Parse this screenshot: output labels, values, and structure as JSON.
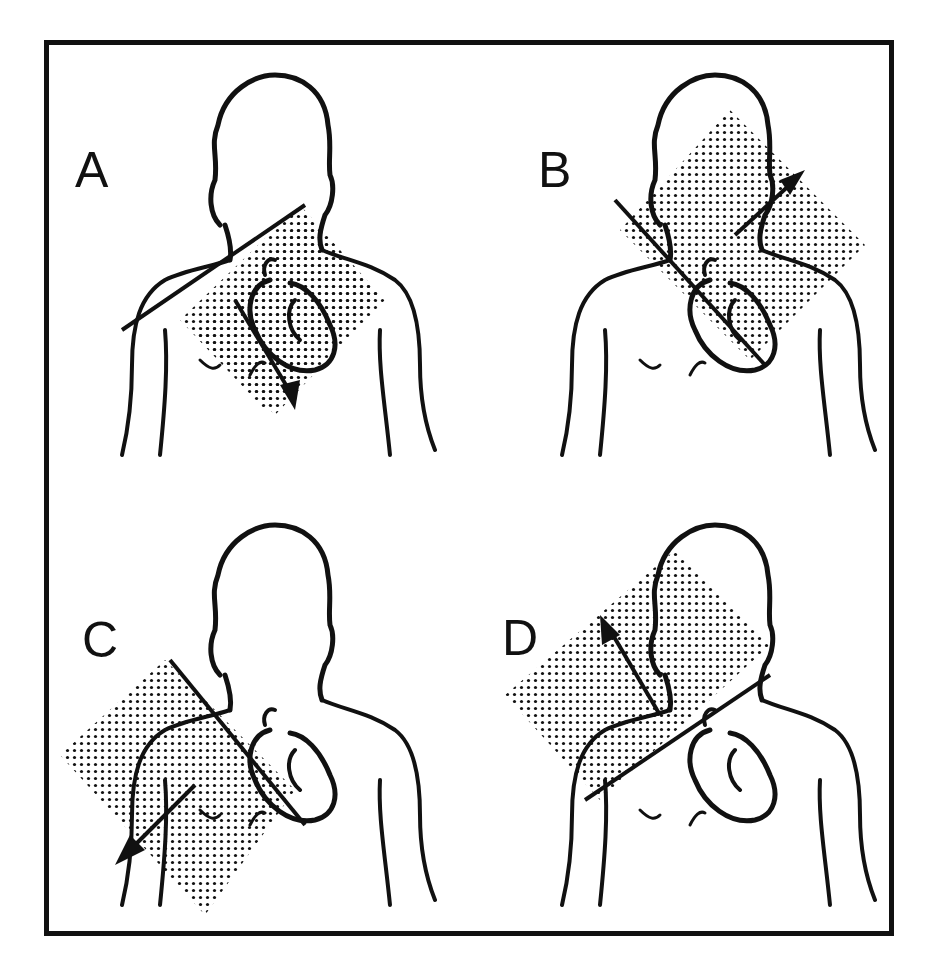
{
  "figure": {
    "colors": {
      "line": "#111111",
      "dots": "#111111",
      "background": "#ffffff"
    },
    "panels": [
      {
        "id": "A",
        "label": "A",
        "axis_arrow": "down-right",
        "shaded_region": "lower-left diamond"
      },
      {
        "id": "B",
        "label": "B",
        "axis_arrow": "up-right",
        "shaded_region": "upper-right diamond"
      },
      {
        "id": "C",
        "label": "C",
        "axis_arrow": "down-left",
        "shaded_region": "lower-left diamond"
      },
      {
        "id": "D",
        "label": "D",
        "axis_arrow": "up-left",
        "shaded_region": "upper-left diamond"
      }
    ]
  }
}
